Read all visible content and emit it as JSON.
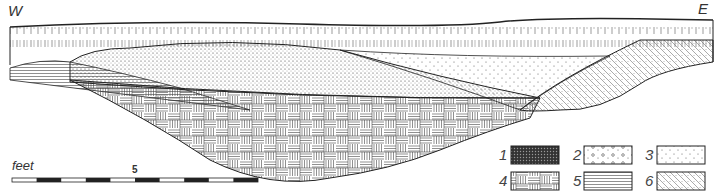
{
  "directions": {
    "west": "W",
    "east": "E"
  },
  "scale": {
    "unit_label": "feet",
    "mid_tick_label": "5",
    "segments": 10
  },
  "legend": [
    {
      "num": "1",
      "pattern": "dense-dark-gravel"
    },
    {
      "num": "2",
      "pattern": "circles-pebbles"
    },
    {
      "num": "3",
      "pattern": "sparse-dots"
    },
    {
      "num": "4",
      "pattern": "basketweave-hatch"
    },
    {
      "num": "5",
      "pattern": "horizontal-lines"
    },
    {
      "num": "6",
      "pattern": "diagonal-cross-dots"
    }
  ],
  "colors": {
    "ink": "#222222",
    "paper": "#ffffff"
  }
}
